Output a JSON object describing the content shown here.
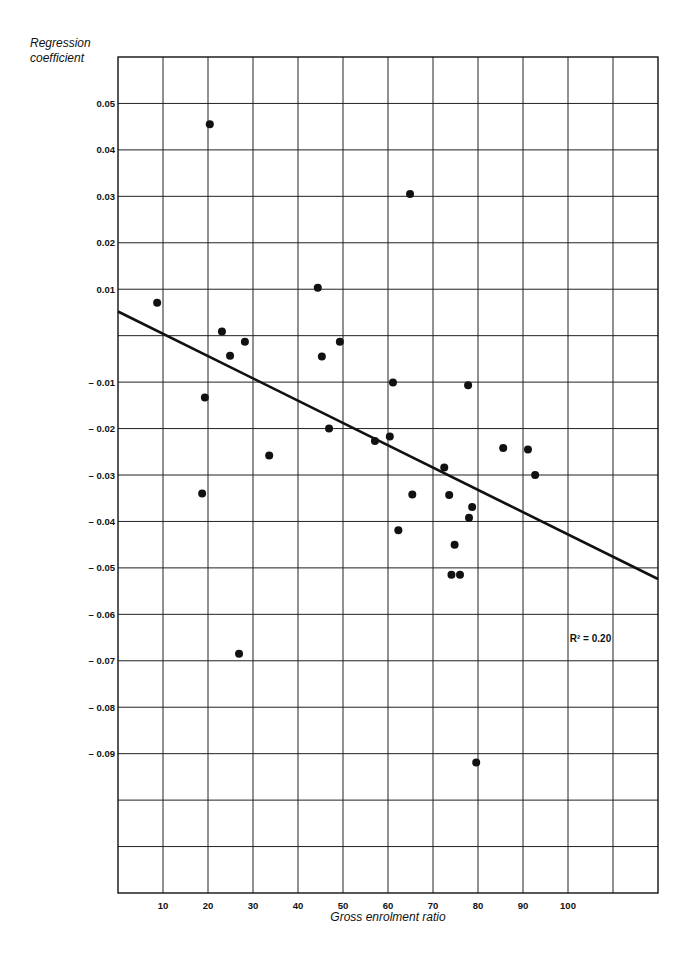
{
  "chart_data": {
    "type": "scatter",
    "title": "",
    "xlabel": "Gross enrolment ratio",
    "ylabel": "Regression coefficient",
    "xlim": [
      0,
      120
    ],
    "ylim": [
      -0.12,
      0.06
    ],
    "grid": true,
    "x_grid_step": 10,
    "y_grid_step": 0.01,
    "x_tick_labels": [
      "10",
      "20",
      "30",
      "40",
      "50",
      "60",
      "70",
      "80",
      "90",
      "100"
    ],
    "x_tick_values": [
      10,
      20,
      30,
      40,
      50,
      60,
      70,
      80,
      90,
      100
    ],
    "y_tick_labels": [
      "0.05",
      "0.04",
      "0.03",
      "0.02",
      "0.01",
      "-0.01",
      "-0.02",
      "-0.03",
      "-0.04",
      "-0.05",
      "-0.06",
      "-0.07",
      "-0.08",
      "-0.09"
    ],
    "y_tick_values": [
      0.05,
      0.04,
      0.03,
      0.02,
      0.01,
      -0.01,
      -0.02,
      -0.03,
      -0.04,
      -0.05,
      -0.06,
      -0.07,
      -0.08,
      -0.09
    ],
    "points": [
      {
        "x": 8.7,
        "y": 0.0071
      },
      {
        "x": 20.4,
        "y": 0.0455
      },
      {
        "x": 23.1,
        "y": 0.0009
      },
      {
        "x": 24.9,
        "y": -0.0043
      },
      {
        "x": 28.2,
        "y": -0.0013
      },
      {
        "x": 19.3,
        "y": -0.0133
      },
      {
        "x": 18.7,
        "y": -0.034
      },
      {
        "x": 33.6,
        "y": -0.0258
      },
      {
        "x": 26.9,
        "y": -0.0685
      },
      {
        "x": 44.4,
        "y": 0.0103
      },
      {
        "x": 45.3,
        "y": -0.0045
      },
      {
        "x": 49.3,
        "y": -0.0013
      },
      {
        "x": 46.9,
        "y": -0.02
      },
      {
        "x": 57.1,
        "y": -0.0227
      },
      {
        "x": 60.4,
        "y": -0.0217
      },
      {
        "x": 61.1,
        "y": -0.0101
      },
      {
        "x": 64.9,
        "y": 0.0305
      },
      {
        "x": 65.4,
        "y": -0.0342
      },
      {
        "x": 62.3,
        "y": -0.0419
      },
      {
        "x": 72.5,
        "y": -0.0284
      },
      {
        "x": 73.6,
        "y": -0.0343
      },
      {
        "x": 74.8,
        "y": -0.045
      },
      {
        "x": 74.1,
        "y": -0.0515
      },
      {
        "x": 76.0,
        "y": -0.0515
      },
      {
        "x": 77.8,
        "y": -0.0107
      },
      {
        "x": 78.0,
        "y": -0.0392
      },
      {
        "x": 78.7,
        "y": -0.0369
      },
      {
        "x": 79.6,
        "y": -0.0919
      },
      {
        "x": 85.6,
        "y": -0.0242
      },
      {
        "x": 91.1,
        "y": -0.0245
      },
      {
        "x": 92.7,
        "y": -0.03
      }
    ],
    "regression_line": {
      "x0": 0,
      "y0": 0.0052,
      "x1": 120,
      "y1": -0.0524
    },
    "annotations": [
      {
        "text": "R² = 0.20",
        "x": 105,
        "y": -0.065
      }
    ]
  }
}
